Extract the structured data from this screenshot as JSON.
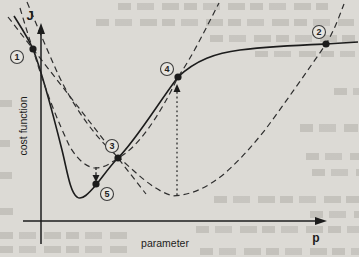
{
  "figure": {
    "labels": [
      {
        "name": "y-axis-symbol",
        "text": "J",
        "x": 30,
        "y": 20,
        "size": 13,
        "bold": true,
        "rotate": 0
      },
      {
        "name": "x-axis-symbol",
        "text": "p",
        "x": 316,
        "y": 242,
        "size": 12,
        "bold": true,
        "rotate": 0
      },
      {
        "name": "x-axis-caption",
        "text": "parameter",
        "x": 165,
        "y": 247,
        "size": 10.5,
        "bold": false,
        "rotate": 0
      },
      {
        "name": "y-axis-caption",
        "text": "cost function",
        "x": 27,
        "y": 126,
        "size": 10.5,
        "bold": false,
        "rotate": -90
      }
    ],
    "axes": [
      {
        "name": "y-axis",
        "x1": 41,
        "y1": 244,
        "x2": 41,
        "y2": 32,
        "head": [
          [
            41,
            23
          ],
          [
            37,
            34
          ],
          [
            45,
            34
          ]
        ]
      },
      {
        "name": "x-axis",
        "x1": 23,
        "y1": 221,
        "x2": 316,
        "y2": 221,
        "head": [
          [
            327,
            221
          ],
          [
            315,
            217
          ],
          [
            315,
            225
          ]
        ]
      }
    ],
    "curves": [
      {
        "name": "cost-function-curve",
        "style": "solid",
        "path": "M 14,16 C 24,32 28,38 33,49 C 44,78 54,118 62,150 C 67,170 70,192 77,197 C 82,201 89,193 96,185 C 104,175 110,166 118,158 C 136,140 157,105 178,77 C 196,60 216,53 240,50 C 272,46 300,45 326,44 L 358,42"
      },
      {
        "name": "narrow-quadratic-approximation",
        "style": "dashed",
        "path": "M 20,8 C 26,28 29,38 33,49 C 45,90 58,122 70,147 C 78,160 87,168 96,168 C 104,168 111,163 118,158 C 138,148 160,115 178,77 C 192,57 205,30 219,3"
      },
      {
        "name": "wide-quadratic-approximation",
        "style": "dashed",
        "path": "M 27,2 C 38,28 48,52 58,74 C 76,112 98,140 118,157 C 136,172 152,190 173,196 C 192,195 208,187 224,174 C 240,160 252,146 265,130 C 285,103 308,70 326,44 C 334,31 339,17 344,4"
      },
      {
        "name": "tangent-line",
        "style": "dashed",
        "path": "M 8,17 L 146,194"
      }
    ],
    "arrows": [
      {
        "name": "step-down-arrow",
        "style": "smalldash",
        "x1": 96,
        "y1": 167,
        "x2": 96,
        "y2": 176,
        "head": [
          [
            96,
            182
          ],
          [
            92.5,
            175
          ],
          [
            99.5,
            175
          ]
        ]
      },
      {
        "name": "evaluation-up-arrow",
        "style": "dotted",
        "x1": 177,
        "y1": 195,
        "x2": 177,
        "y2": 91,
        "head": [
          [
            177,
            84
          ],
          [
            173.5,
            92
          ],
          [
            180.5,
            92
          ]
        ]
      }
    ],
    "markers": [
      {
        "label": "1",
        "dot": [
          33,
          49
        ],
        "circle": [
          17,
          57
        ]
      },
      {
        "label": "2",
        "dot": [
          326,
          44
        ],
        "circle": [
          319,
          32
        ]
      },
      {
        "label": "3",
        "dot": [
          118,
          158
        ],
        "circle": [
          112,
          146
        ]
      },
      {
        "label": "4",
        "dot": [
          178,
          77
        ],
        "circle": [
          167,
          69
        ]
      },
      {
        "label": "5",
        "dot": [
          96,
          184
        ],
        "circle": [
          107,
          194
        ]
      }
    ]
  },
  "colors": {
    "paper": "#dcdad5",
    "ink": "#1c1c1c",
    "dash_ink": "#2e2e2e",
    "marker_circle_fill": "#e6e4df",
    "marker_circle_stroke": "#3c3c3c"
  }
}
